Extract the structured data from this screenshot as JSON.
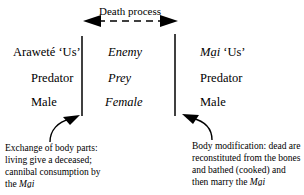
{
  "diagram": {
    "top_arrow": {
      "label": "Death process",
      "direction": "bidirectional",
      "style": "dashed"
    },
    "left_column": {
      "title": "Araweté ‘Us’",
      "role": "Predator",
      "gender": "Male"
    },
    "middle_column": {
      "title": "Enemy",
      "role": "Prey",
      "gender": "Female"
    },
    "right_column": {
      "title_name": "Ma̱i",
      "title_suffix": " ‘Us’",
      "role": "Predator",
      "gender": "Male"
    },
    "left_note": {
      "text": "Exchange of body parts: living give a deceased; cannibal consumption by the ",
      "emph": "Ma̱i"
    },
    "right_note": {
      "text": "Body modification: dead are reconstituted from the bones and bathed (cooked) and then marry the ",
      "emph": "Ma̱i"
    }
  }
}
